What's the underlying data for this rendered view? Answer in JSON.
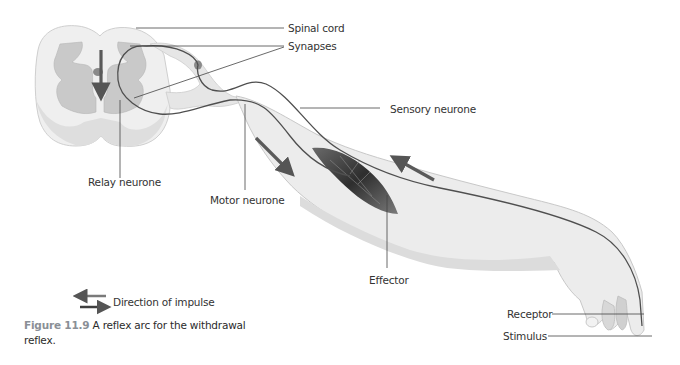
{
  "figure": {
    "labels": {
      "spinal_cord": "Spinal cord",
      "synapses": "Synapses",
      "sensory_neurone": "Sensory neurone",
      "relay_neurone": "Relay neurone",
      "motor_neurone": "Motor neurone",
      "effector": "Effector",
      "receptor": "Receptor",
      "stimulus": "Stimulus"
    },
    "legend": {
      "direction_of_impulse": "Direction of impulse"
    },
    "caption": {
      "number": "Figure 11.9",
      "text": " A reflex arc for the withdrawal reflex."
    },
    "colors": {
      "arrow": "#5a5a5a",
      "nerve": "#4f4f4f",
      "tissue_light": "#ececec",
      "tissue_mid": "#d9d9d9",
      "grey_matter": "#c4c4c4",
      "muscle": "#3a3a3a",
      "leader_line": "#444444"
    }
  }
}
